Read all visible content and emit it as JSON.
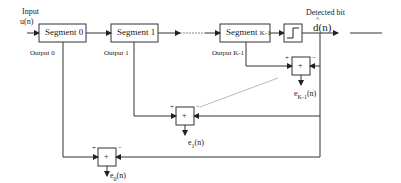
{
  "input": {
    "title": "Input",
    "signal": "u(n)"
  },
  "segments": [
    {
      "label": "Segment 0",
      "output": "Output 0"
    },
    {
      "label": "Segment 1",
      "output": "Output 1"
    },
    {
      "label": "Segment",
      "label_suffix": "K-1",
      "output": "Output K-1"
    }
  ],
  "detector": {
    "title": "Detected bit",
    "signal": "d(n)",
    "hat": "^"
  },
  "adders": [
    {
      "symbol": "+",
      "plus": "+",
      "minus": "−",
      "error_base": "e",
      "error_sub": "K-1",
      "error_arg": "(n)"
    },
    {
      "symbol": "+",
      "plus": "+",
      "minus": "−",
      "error_base": "e",
      "error_sub": "1",
      "error_arg": "(n)"
    },
    {
      "symbol": "+",
      "plus": "+",
      "minus": "−",
      "error_base": "e",
      "error_sub": "0",
      "error_arg": "(n)"
    }
  ],
  "colors": {
    "line": "#333333",
    "dashed": "#888888",
    "background": "#ffffff"
  }
}
